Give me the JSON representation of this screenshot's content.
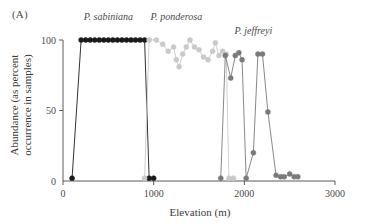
{
  "panel": {
    "label": "(A)"
  },
  "chart_data": {
    "type": "line",
    "title": "",
    "xlabel": "Elevation (m)",
    "ylabel": "Abundance (as percent occurrence in samples)",
    "ylabel_line1": "Abundance (as percent",
    "ylabel_line2": "occurrence in samples)",
    "xlim": [
      0,
      3000
    ],
    "ylim": [
      0,
      100
    ],
    "xticks": [
      0,
      1000,
      2000,
      3000
    ],
    "xtick_labels": [
      "0",
      "1000",
      "2000",
      "3000"
    ],
    "yticks": [
      0,
      50,
      100
    ],
    "ytick_labels": [
      "0",
      "50",
      "100"
    ],
    "grid": false,
    "legend_position": "inline-annotations",
    "series": [
      {
        "name": "P. sabiniana",
        "color": "#1a1a1a",
        "marker": "circle",
        "label_x": 500,
        "label_y": 114,
        "points": [
          [
            100,
            2
          ],
          [
            200,
            100
          ],
          [
            250,
            100
          ],
          [
            300,
            100
          ],
          [
            350,
            100
          ],
          [
            400,
            100
          ],
          [
            450,
            100
          ],
          [
            500,
            100
          ],
          [
            550,
            100
          ],
          [
            600,
            100
          ],
          [
            650,
            100
          ],
          [
            700,
            100
          ],
          [
            750,
            100
          ],
          [
            800,
            100
          ],
          [
            850,
            100
          ],
          [
            900,
            100
          ],
          [
            950,
            2
          ],
          [
            1000,
            2
          ]
        ]
      },
      {
        "name": "P. ponderosa",
        "color": "#c9c9c9",
        "marker": "circle",
        "label_x": 1250,
        "label_y": 114,
        "points": [
          [
            900,
            2
          ],
          [
            950,
            100
          ],
          [
            1030,
            100
          ],
          [
            1100,
            97
          ],
          [
            1160,
            92
          ],
          [
            1220,
            95
          ],
          [
            1250,
            86
          ],
          [
            1280,
            81
          ],
          [
            1320,
            90
          ],
          [
            1360,
            95
          ],
          [
            1400,
            100
          ],
          [
            1450,
            95
          ],
          [
            1500,
            93
          ],
          [
            1550,
            88
          ],
          [
            1600,
            86
          ],
          [
            1650,
            92
          ],
          [
            1680,
            98
          ],
          [
            1720,
            89
          ],
          [
            1760,
            92
          ],
          [
            1800,
            90
          ],
          [
            1830,
            2
          ],
          [
            1880,
            2
          ]
        ]
      },
      {
        "name": "P. jeffreyi",
        "color": "#7a7a7a",
        "marker": "circle",
        "label_x": 2100,
        "label_y": 104,
        "points": [
          [
            1740,
            2
          ],
          [
            1790,
            89
          ],
          [
            1850,
            73
          ],
          [
            1900,
            89
          ],
          [
            1940,
            91
          ],
          [
            1975,
            86
          ],
          [
            2020,
            2
          ],
          [
            2100,
            20
          ],
          [
            2150,
            90
          ],
          [
            2200,
            90
          ],
          [
            2260,
            49
          ],
          [
            2350,
            4
          ],
          [
            2400,
            3
          ],
          [
            2440,
            3
          ],
          [
            2500,
            5
          ],
          [
            2550,
            3
          ],
          [
            2590,
            3
          ]
        ]
      }
    ]
  }
}
